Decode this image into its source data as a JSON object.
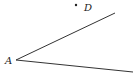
{
  "diagram": {
    "type": "angle",
    "colors": {
      "stroke": "#333333",
      "text": "#222222",
      "background": "#ffffff"
    },
    "vertex": {
      "label": "A",
      "x": 16,
      "y": 60
    },
    "rays": [
      {
        "name": "upper-ray",
        "x1": 16,
        "y1": 60,
        "x2": 115,
        "y2": 13
      },
      {
        "name": "lower-ray",
        "x1": 16,
        "y1": 60,
        "x2": 133,
        "y2": 72
      }
    ],
    "points": [
      {
        "label": "D",
        "x": 76,
        "y": 5
      }
    ]
  }
}
